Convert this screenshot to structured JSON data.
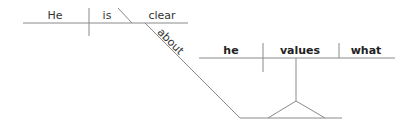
{
  "diagram": {
    "type": "sentence-diagram",
    "main_clause": {
      "subject": "He",
      "verb": "is",
      "predicate_adjective": "clear",
      "modifier_preposition": "about"
    },
    "noun_clause": {
      "subject": "he",
      "verb": "values",
      "object": "what"
    },
    "colors": {
      "line": "#8a8a8a",
      "text": "#333333"
    }
  }
}
